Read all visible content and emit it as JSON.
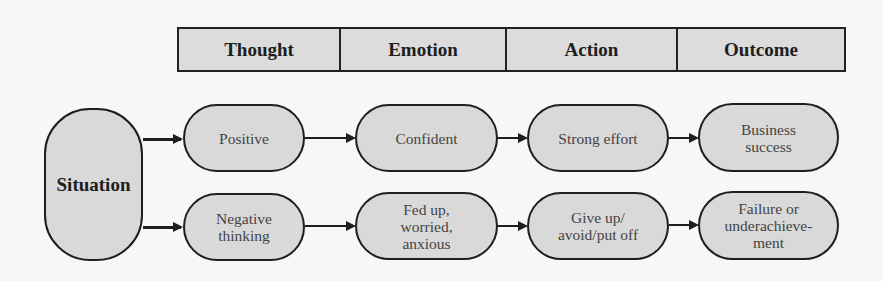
{
  "header": {
    "columns": [
      "Thought",
      "Emotion",
      "Action",
      "Outcome"
    ]
  },
  "situation": {
    "label": "Situation"
  },
  "rows": {
    "positive": {
      "thought": "Positive",
      "emotion": "Confident",
      "action": "Strong effort",
      "outcome": [
        "Business",
        "success"
      ]
    },
    "negative": {
      "thought": [
        "Negative",
        "thinking"
      ],
      "emotion": [
        "Fed up,",
        "worried,",
        "anxious"
      ],
      "action": [
        "Give up/",
        "avoid/put off"
      ],
      "outcome": [
        "Failure or",
        "underachieve-",
        "ment"
      ]
    }
  },
  "colors": {
    "background": "#f7f7f5",
    "box_fill": "#d9d9d9",
    "stroke": "#1e1e1e",
    "text": "#444444"
  }
}
